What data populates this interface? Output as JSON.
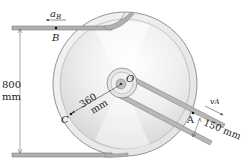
{
  "figure": {
    "labels": {
      "a_B": "a",
      "a_B_sub": "B",
      "B": "B",
      "O": "O",
      "C": "C",
      "A": "A",
      "v_A": "v",
      "v_A_sub": "A",
      "height_value": "800",
      "height_unit": "mm",
      "radius_value": "360",
      "radius_unit": "mm",
      "inner_dim": "150 mm"
    },
    "colors": {
      "belt": "#a8a8a8",
      "belt_edge": "#6e6e6e",
      "disc_outline": "#7a7a7a",
      "text": "#222222"
    }
  }
}
